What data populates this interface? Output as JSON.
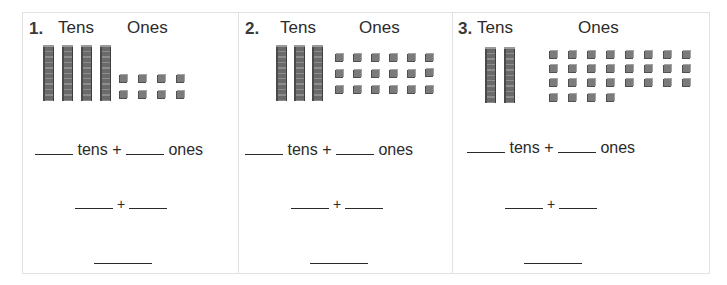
{
  "worksheet": {
    "problems": [
      {
        "number": "1.",
        "tens_label": "Tens",
        "ones_label": "Ones",
        "tens_rods": 4,
        "ones_cubes": 8,
        "line1": {
          "tens_word": "tens",
          "plus": "+",
          "ones_word": "ones"
        },
        "line2": {
          "plus": "+"
        }
      },
      {
        "number": "2.",
        "tens_label": "Tens",
        "ones_label": "Ones",
        "tens_rods": 3,
        "ones_cubes": 18,
        "line1": {
          "tens_word": "tens",
          "plus": "+",
          "ones_word": "ones"
        },
        "line2": {
          "plus": "+"
        }
      },
      {
        "number": "3.",
        "tens_label": "Tens",
        "ones_label": "Ones",
        "tens_rods": 2,
        "ones_cubes": 28,
        "line1": {
          "tens_word": "tens",
          "plus": "+",
          "ones_word": "ones"
        },
        "line2": {
          "plus": "+"
        }
      }
    ],
    "colors": {
      "border": "#e2e2e2",
      "text": "#2b2b2b",
      "block": "#7b7b7b"
    }
  }
}
